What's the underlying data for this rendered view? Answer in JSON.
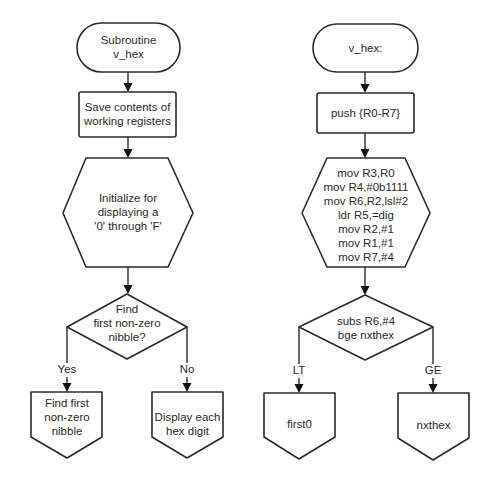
{
  "left_flowchart": {
    "title": "Pseudocode flowchart",
    "start": {
      "lines": [
        "Subroutine",
        "v_hex"
      ]
    },
    "save": {
      "lines": [
        "Save contents of",
        "working registers"
      ]
    },
    "init": {
      "lines": [
        "Initialize for",
        "displaying a",
        "'0' through 'F'"
      ]
    },
    "decision": {
      "lines": [
        "Find",
        "first non-zero",
        "nibble?"
      ]
    },
    "branch_yes": {
      "label": "Yes"
    },
    "branch_no": {
      "label": "No"
    },
    "connector_yes": {
      "lines": [
        "Find first",
        "non-zero",
        "nibble"
      ]
    },
    "connector_no": {
      "lines": [
        "Display each",
        "hex digit"
      ]
    }
  },
  "right_flowchart": {
    "title": "Assembly flowchart",
    "start": {
      "lines": [
        "v_hex:"
      ]
    },
    "save": {
      "lines": [
        "push {R0-R7}"
      ]
    },
    "init": {
      "lines": [
        "mov  R3,R0",
        "mov R4,#0b1111",
        "mov  R6,R2,lsl#2",
        "ldr  R5,=dig",
        "mov  R2,#1",
        "mov  R1,#1",
        "mov  R7,#4"
      ]
    },
    "decision": {
      "lines": [
        "subs  R6,#4",
        "bge nxthex"
      ]
    },
    "branch_lt": {
      "label": "LT"
    },
    "branch_ge": {
      "label": "GE"
    },
    "connector_lt": {
      "lines": [
        "first0"
      ]
    },
    "connector_ge": {
      "lines": [
        "nxthex"
      ]
    }
  },
  "colors": {
    "stroke": "#2a2a2a",
    "text": "#2a2a2a",
    "background": "#ffffff"
  }
}
